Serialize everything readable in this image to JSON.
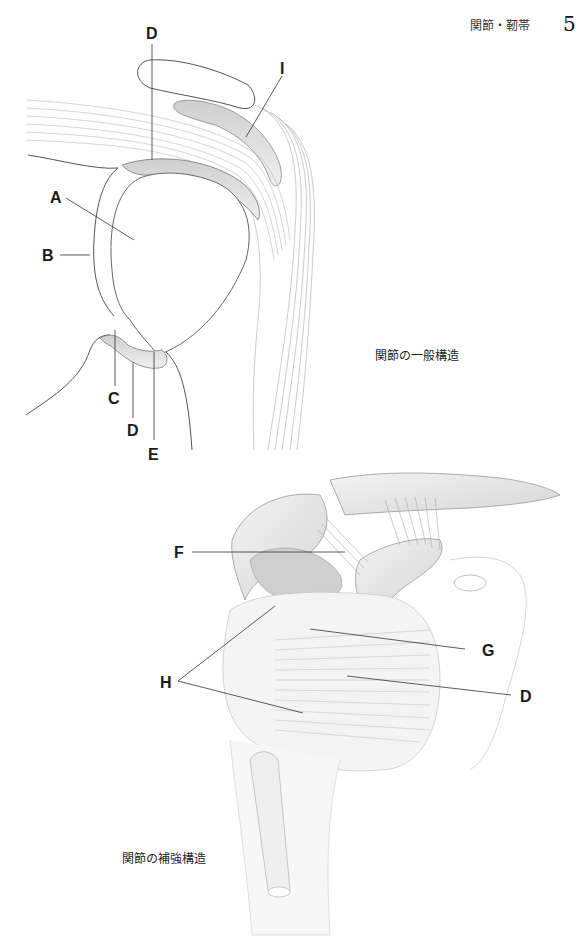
{
  "header": {
    "chapter_title": "関節・靭帯",
    "page_number": "5"
  },
  "figure_top": {
    "caption": "関節の一般構造",
    "labels": {
      "A": "A",
      "B": "B",
      "C": "C",
      "D_top": "D",
      "D_bottom": "D",
      "E": "E",
      "I": "I"
    }
  },
  "figure_bottom": {
    "caption": "関節の補強構造",
    "labels": {
      "F": "F",
      "G": "G",
      "H": "H",
      "D": "D"
    }
  }
}
